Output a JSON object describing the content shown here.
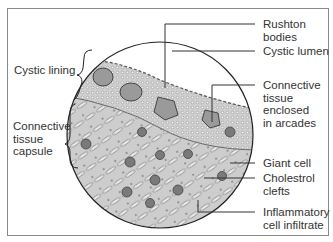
{
  "figure": {
    "left_labels": [
      {
        "id": "cystic-lining",
        "text": "Cystic lining"
      },
      {
        "id": "connective-tissue-capsule",
        "text": "Connective\ntissue\ncapsule"
      }
    ],
    "right_labels": [
      {
        "id": "rushton-bodies",
        "text": "Rushton\nbodies"
      },
      {
        "id": "cystic-lumen",
        "text": "Cystic lumen"
      },
      {
        "id": "connective-tissue-arcades",
        "text": "Connective\ntissue\nenclosed\nin arcades"
      },
      {
        "id": "giant-cell",
        "text": "Giant cell"
      },
      {
        "id": "cholestrol-clefts",
        "text": "Cholestrol\nclefts"
      },
      {
        "id": "inflammatory-infiltrate",
        "text": "Inflammatory\ncell infiltrate"
      }
    ],
    "colors": {
      "frame": "#8a8a8a",
      "line": "#333333",
      "tissue_light": "#d8d8d8",
      "tissue_dark": "#8c8c8c"
    }
  }
}
